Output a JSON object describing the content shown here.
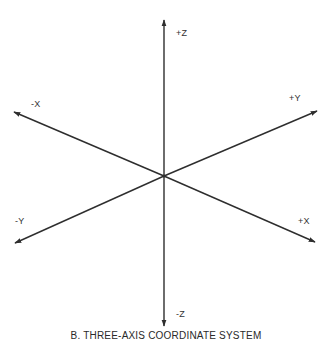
{
  "figure": {
    "caption": "B. THREE-AXIS COORDINATE SYSTEM",
    "origin": {
      "x": 164,
      "y": 176
    },
    "line_color": "#2e2e2e",
    "background": "#ffffff"
  },
  "axes": [
    {
      "id": "pos-z",
      "label": "+Z",
      "tip": {
        "x": 164,
        "y": 20
      }
    },
    {
      "id": "neg-z",
      "label": "-Z",
      "tip": {
        "x": 164,
        "y": 326
      }
    },
    {
      "id": "neg-x",
      "label": "-X",
      "tip": {
        "x": 14,
        "y": 112
      }
    },
    {
      "id": "pos-x",
      "label": "+X",
      "tip": {
        "x": 315,
        "y": 242
      }
    },
    {
      "id": "pos-y",
      "label": "+Y",
      "tip": {
        "x": 317,
        "y": 111
      }
    },
    {
      "id": "neg-y",
      "label": "-Y",
      "tip": {
        "x": 15,
        "y": 243
      }
    }
  ],
  "labels": {
    "pos_z": "+Z",
    "neg_z": "-Z",
    "neg_x": "-X",
    "pos_x": "+X",
    "pos_y": "+Y",
    "neg_y": "-Y"
  }
}
